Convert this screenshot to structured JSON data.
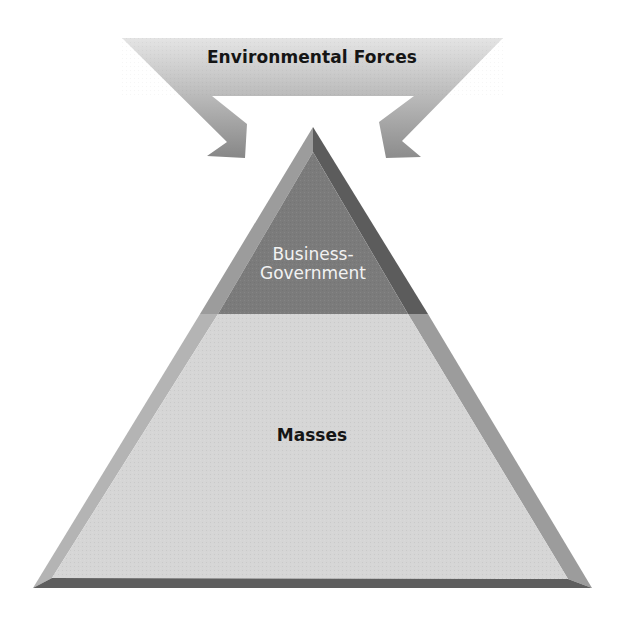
{
  "diagram": {
    "arrows": {
      "label": "Environmental Forces",
      "direction": "both arrows point inward/downward toward pyramid apex",
      "color_top": "#e2e2e2",
      "color_bottom": "#8a8a8a"
    },
    "pyramid": {
      "top_section": {
        "label_line1": "Business-",
        "label_line2": "Government",
        "face_color": "#7b7b7b",
        "left_bevel_color": "#9c9c9c",
        "right_bevel_color": "#5c5c5c"
      },
      "bottom_section": {
        "label": "Masses",
        "face_color": "#d6d6d6",
        "left_bevel_color": "#b4b4b4",
        "right_bevel_color": "#9a9a9a",
        "base_bevel_color": "#5e5e5e"
      }
    }
  }
}
